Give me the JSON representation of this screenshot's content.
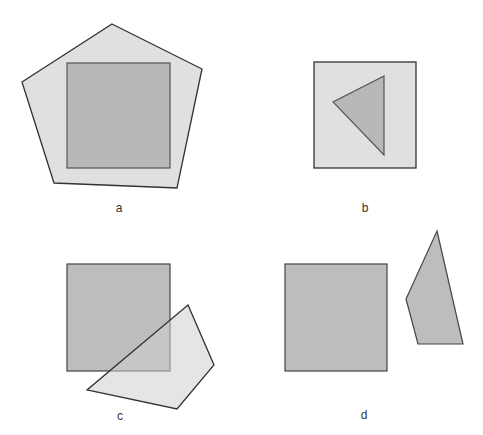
{
  "panels": [
    {
      "id": "a",
      "label": "a",
      "description": "square entirely inside pentagon"
    },
    {
      "id": "b",
      "label": "b",
      "description": "triangle entirely inside square"
    },
    {
      "id": "c",
      "label": "c",
      "description": "square and quadrilateral overlapping"
    },
    {
      "id": "d",
      "label": "d",
      "description": "square and quadrilateral disjoint"
    }
  ],
  "colors": {
    "light_fill": "#e0e0e0",
    "dark_fill": "#b8b8b8",
    "stroke": "#333333",
    "background": "#ffffff"
  }
}
